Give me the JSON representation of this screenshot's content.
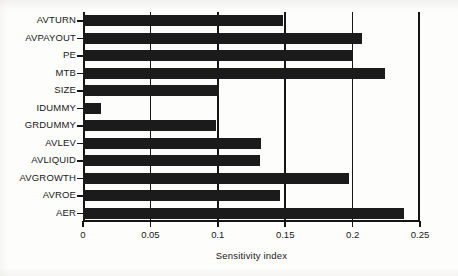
{
  "chart_data": {
    "type": "bar",
    "orientation": "horizontal",
    "title": "",
    "xlabel": "Sensitivity index",
    "ylabel": "",
    "xlim": [
      0,
      0.25
    ],
    "xticks": [
      0,
      0.05,
      0.1,
      0.15,
      0.2,
      0.25
    ],
    "xticklabels": [
      "0",
      "0.05",
      "0.1",
      "0.15",
      "0.2",
      "0.25"
    ],
    "grid": "vertical gridlines at each x tick",
    "legend": "none",
    "bar_color": "#1b1b1b",
    "categories": [
      "AVTURN",
      "AVPAYOUT",
      "PE",
      "MTB",
      "SIZE",
      "IDUMMY",
      "GRDUMMY",
      "AVLEV",
      "AVLIQUID",
      "AVGROWTH",
      "AVROE",
      "AER"
    ],
    "values": [
      0.148,
      0.207,
      0.2,
      0.224,
      0.101,
      0.013,
      0.099,
      0.132,
      0.131,
      0.197,
      0.146,
      0.238
    ]
  }
}
